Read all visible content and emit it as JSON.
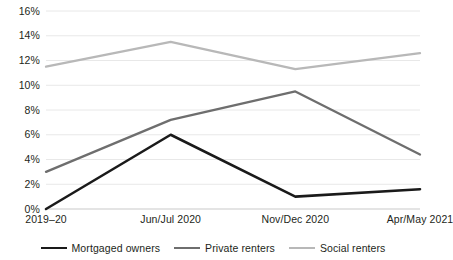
{
  "chart_data": {
    "type": "line",
    "title": "",
    "xlabel": "",
    "ylabel": "",
    "categories": [
      "2019–20",
      "Jun/Jul 2020",
      "Nov/Dec 2020",
      "Apr/May 2021"
    ],
    "ylim": [
      0,
      16
    ],
    "ytick_values": [
      0,
      2,
      4,
      6,
      8,
      10,
      12,
      14,
      16
    ],
    "ytick_labels": [
      "0%",
      "2%",
      "4%",
      "6%",
      "8%",
      "10%",
      "12%",
      "14%",
      "16%"
    ],
    "grid": true,
    "legend_position": "bottom",
    "series": [
      {
        "name": "Mortgaged owners",
        "color": "#1a1a1a",
        "width": 2.6,
        "values": [
          0.0,
          6.0,
          1.0,
          1.6
        ]
      },
      {
        "name": "Private renters",
        "color": "#6e6e6e",
        "width": 2.3,
        "values": [
          3.0,
          7.2,
          9.5,
          4.4
        ]
      },
      {
        "name": "Social renters",
        "color": "#b8b8b8",
        "width": 2.3,
        "values": [
          11.5,
          13.5,
          11.3,
          12.6
        ]
      }
    ],
    "gridline_color": "#e8e8e8",
    "axis_color": "#c9c9c9",
    "text_color": "#231f20"
  }
}
